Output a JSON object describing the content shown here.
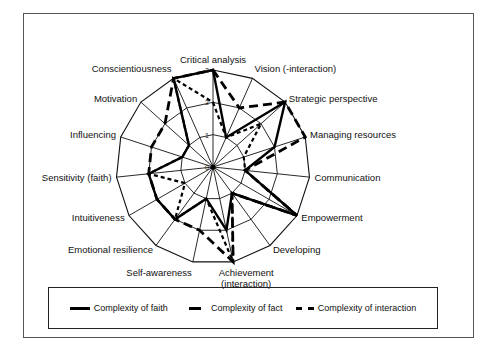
{
  "chart_data": {
    "type": "radar",
    "title": "",
    "categories": [
      "Critical analysis",
      "Vision (-interaction)",
      "Strategic perspective",
      "Managing resources",
      "Communication",
      "Empowerment",
      "Developing",
      "Achievement (interaction)",
      "Self-awareness",
      "Emotional resilience",
      "Intuitiveness",
      "Sensitivity (faith)",
      "Influencing",
      "Motivation",
      "Conscientiousness"
    ],
    "rlim": [
      0,
      3
    ],
    "ticks": [
      "0",
      "1",
      "2",
      "3"
    ],
    "grid": true,
    "legend_position": "bottom",
    "series": [
      {
        "name": "Complexity of faith",
        "style": "solid",
        "values": [
          3,
          1,
          3,
          2,
          1,
          3,
          1,
          2,
          1,
          2,
          2,
          2,
          1,
          1,
          3
        ]
      },
      {
        "name": "Complexity of fact",
        "style": "long-dash",
        "values": [
          3,
          2,
          3,
          3,
          1,
          3,
          1,
          3,
          2,
          2,
          2,
          2,
          2,
          2,
          3
        ]
      },
      {
        "name": "Complexity of interaction",
        "style": "short-dash",
        "values": [
          2,
          1,
          2,
          1,
          1,
          3,
          1,
          3,
          1,
          2,
          1,
          2,
          1,
          1,
          3
        ]
      }
    ]
  },
  "legend": {
    "items": [
      {
        "label": "Complexity of faith"
      },
      {
        "label": "Complexity of fact"
      },
      {
        "label": "Complexity of interaction"
      }
    ]
  }
}
